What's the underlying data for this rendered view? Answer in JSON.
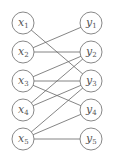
{
  "diagram": {
    "type": "bipartite-graph",
    "left_nodes": [
      {
        "id": "x1",
        "base": "x",
        "sub": "1"
      },
      {
        "id": "x2",
        "base": "x",
        "sub": "2"
      },
      {
        "id": "x3",
        "base": "x",
        "sub": "3"
      },
      {
        "id": "x4",
        "base": "x",
        "sub": "4"
      },
      {
        "id": "x5",
        "base": "x",
        "sub": "5"
      }
    ],
    "right_nodes": [
      {
        "id": "y1",
        "base": "y",
        "sub": "1"
      },
      {
        "id": "y2",
        "base": "y",
        "sub": "2"
      },
      {
        "id": "y3",
        "base": "y",
        "sub": "3"
      },
      {
        "id": "y4",
        "base": "y",
        "sub": "4"
      },
      {
        "id": "y5",
        "base": "y",
        "sub": "5"
      }
    ],
    "edges": [
      [
        "x1",
        "y3"
      ],
      [
        "x2",
        "y1"
      ],
      [
        "x2",
        "y2"
      ],
      [
        "x3",
        "y2"
      ],
      [
        "x3",
        "y3"
      ],
      [
        "x3",
        "y4"
      ],
      [
        "x4",
        "y2"
      ],
      [
        "x4",
        "y3"
      ],
      [
        "x5",
        "y3"
      ],
      [
        "x5",
        "y4"
      ],
      [
        "x5",
        "y5"
      ]
    ]
  }
}
